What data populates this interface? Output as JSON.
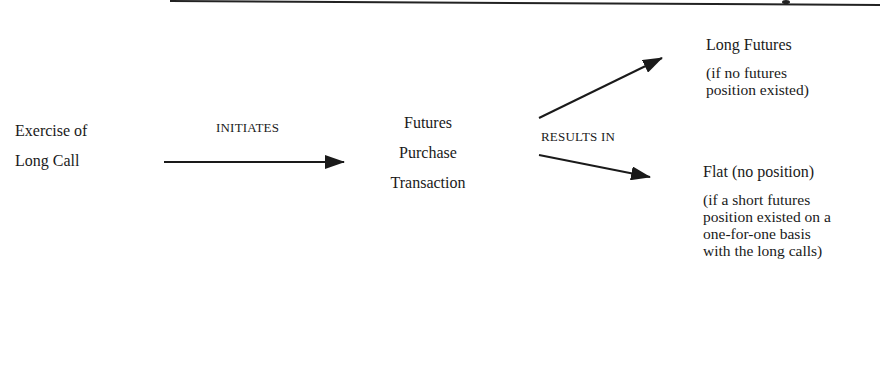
{
  "diagram": {
    "source_node": {
      "lines": [
        "Exercise of",
        "Long Call"
      ]
    },
    "edge_initiates": {
      "label": "INITIATES"
    },
    "middle_node": {
      "lines": [
        "Futures",
        "Purchase",
        "Transaction"
      ]
    },
    "edge_results": {
      "label": "RESULTS IN"
    },
    "outcomes": [
      {
        "title": "Long Futures",
        "note_lines": [
          "(if no futures",
          "position existed)"
        ]
      },
      {
        "title": "Flat (no position)",
        "note_lines": [
          "(if a short futures",
          "position existed on a",
          "one-for-one basis",
          "with the long calls)"
        ]
      }
    ],
    "colors": {
      "ink": "#1a1a1a",
      "background": "#ffffff"
    }
  }
}
